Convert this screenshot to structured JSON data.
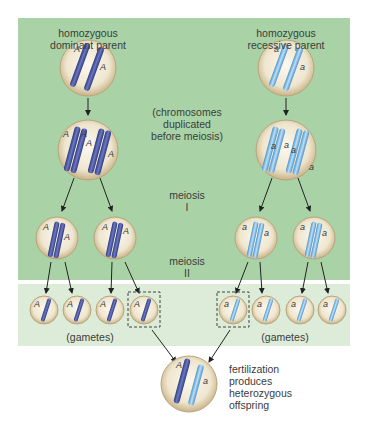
{
  "labels": {
    "dominant_parent": [
      "homozygous",
      "dominant parent"
    ],
    "recessive_parent": [
      "homozygous",
      "recessive parent"
    ],
    "duplication_note": [
      "(chromosomes",
      "duplicated",
      "before meiosis)"
    ],
    "meiosis_1": [
      "meiosis",
      "I"
    ],
    "meiosis_2": [
      "meiosis",
      "II"
    ],
    "gametes_left": "(gametes)",
    "gametes_right": "(gametes)",
    "fertilization": [
      "fertilization",
      "produces",
      "heterozygous",
      "offspring"
    ]
  },
  "alleles": {
    "dominant": "A",
    "recessive": "a"
  },
  "colors": {
    "panel_top": "#a9d3a6",
    "panel_bottom": "#dcecd8",
    "cell_fill": "#efe6cf",
    "cell_rim": "#b9a47c",
    "dominant_chromosome": "#4a57a3",
    "recessive_chromosome": "#8ec3ea",
    "arrow": "#222222"
  }
}
